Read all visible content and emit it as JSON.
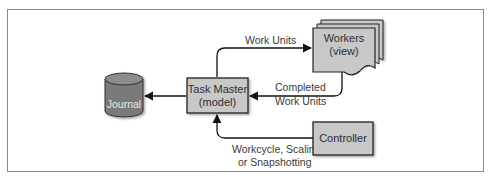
{
  "diagram": {
    "nodes": {
      "journal": {
        "label": "Journal",
        "shape": "cylinder",
        "fill": "#7a7a7a"
      },
      "task_master": {
        "line1": "Task Master",
        "line2": "(model)",
        "shape": "box",
        "fill": "#c8c8c8"
      },
      "workers": {
        "line1": "Workers",
        "line2": "(view)",
        "shape": "stacked-document",
        "fill": "#c8c8c8"
      },
      "controller": {
        "label": "Controller",
        "shape": "box",
        "fill": "#c8c8c8"
      }
    },
    "edges": {
      "work_units": {
        "label": "Work Units",
        "from": "task_master",
        "to": "workers"
      },
      "completed": {
        "line1": "Completed",
        "line2": "Work Units",
        "from": "workers",
        "to": "task_master"
      },
      "control": {
        "line1": "Workcycle, Scaling,",
        "line2": "or Snapshotting",
        "from": "controller",
        "to": "task_master"
      },
      "journal": {
        "from": "task_master",
        "to": "journal"
      }
    }
  }
}
